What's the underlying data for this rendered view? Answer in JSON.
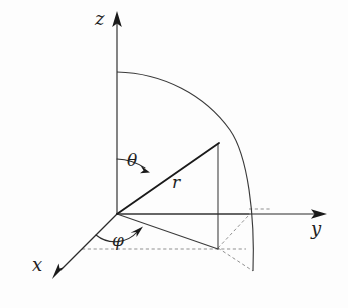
{
  "figure": {
    "name": "spherical-coordinate-system",
    "background_color": "#fdfdfd",
    "line_color": "#2b2b2b",
    "dashed_color": "#8a8a8a",
    "radius_color": "#1a1a1a"
  },
  "axes": [
    {
      "id": "z",
      "label": "z",
      "direction": "up",
      "origin": {
        "x": 117,
        "y": 214
      },
      "tip": {
        "x": 117,
        "y": 16
      }
    },
    {
      "id": "y",
      "label": "y",
      "direction": "right",
      "origin": {
        "x": 117,
        "y": 214
      },
      "tip": {
        "x": 324,
        "y": 214
      }
    },
    {
      "id": "x",
      "label": "x",
      "direction": "down-left",
      "origin": {
        "x": 117,
        "y": 214
      },
      "tip": {
        "x": 54,
        "y": 277
      }
    }
  ],
  "angles": [
    {
      "id": "theta",
      "label": "θ",
      "description": "polar angle from z-axis to radius vector",
      "vertex": {
        "x": 117,
        "y": 214
      },
      "from_axis": "z",
      "to": "radius-vector",
      "arrow": true
    },
    {
      "id": "phi",
      "label": "φ",
      "description": "azimuthal angle in xy-plane measured from x-axis",
      "vertex": {
        "x": 117,
        "y": 214
      },
      "from_axis": "x",
      "to": "xy-projection",
      "arrow": true
    }
  ],
  "vectors": [
    {
      "id": "r",
      "label": "r",
      "description": "radius vector from origin to point on sphere",
      "start": {
        "x": 117,
        "y": 214
      },
      "end": {
        "x": 218,
        "y": 144
      }
    }
  ],
  "points": [
    {
      "id": "origin",
      "label": "",
      "x": 117,
      "y": 214
    },
    {
      "id": "point-P",
      "label": "",
      "x": 218,
      "y": 144
    },
    {
      "id": "projection-xy",
      "label": "",
      "x": 218,
      "y": 248
    }
  ],
  "arc": {
    "id": "sphere-quarter-arc",
    "description": "quarter circle from z-axis down to xy-plane",
    "start": {
      "x": 117,
      "y": 72
    },
    "end": {
      "x": 253,
      "y": 271
    }
  },
  "construction_lines": [
    {
      "id": "xy-projection-line",
      "style": "solid",
      "from": {
        "x": 117,
        "y": 214
      },
      "to": {
        "x": 218,
        "y": 248
      }
    },
    {
      "id": "vertical-dropline",
      "style": "solid",
      "from": {
        "x": 218,
        "y": 144
      },
      "to": {
        "x": 218,
        "y": 248
      }
    },
    {
      "id": "horizontal-guide-to-y-axis",
      "style": "solid",
      "from": {
        "x": 117,
        "y": 214
      },
      "to": {
        "x": 248,
        "y": 214
      }
    },
    {
      "id": "vertical-guide-upper",
      "style": "solid",
      "from": {
        "x": 218,
        "y": 144
      },
      "to": {
        "x": 218,
        "y": 214
      }
    },
    {
      "id": "x-axis-dashed-baseline",
      "style": "dashed",
      "from": {
        "x": 82,
        "y": 249
      },
      "to": {
        "x": 244,
        "y": 249
      }
    },
    {
      "id": "dashed-diagonal-to-arc",
      "style": "dashed",
      "from": {
        "x": 218,
        "y": 248
      },
      "to": {
        "x": 253,
        "y": 271
      }
    },
    {
      "id": "dashed-projection-diagonal",
      "style": "dashed",
      "from": {
        "x": 218,
        "y": 248
      },
      "to": {
        "x": 248,
        "y": 214
      }
    },
    {
      "id": "y-axis-dashed-tick",
      "style": "dashed",
      "from": {
        "x": 248,
        "y": 210
      },
      "to": {
        "x": 268,
        "y": 210
      }
    }
  ]
}
